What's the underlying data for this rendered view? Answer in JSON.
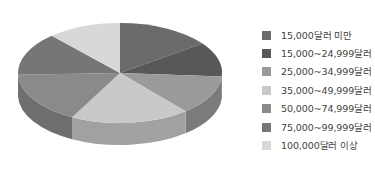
{
  "chart_data": {
    "type": "pie",
    "title": "",
    "subtitle": "",
    "xlabel": "",
    "ylabel": "",
    "three_d": true,
    "legend_position": "right",
    "grid": false,
    "categories": [
      "15,000달러 미만",
      "15,000~24,999달러",
      "25,000~34,999달러",
      "35,000~49,999달러",
      "50,000~74,999달러",
      "75,000~99,999달러",
      "100,000달러 이상"
    ],
    "values": [
      15,
      11,
      13,
      19,
      17,
      14,
      11
    ],
    "colors": [
      "#6b6b6b",
      "#585858",
      "#9a9a9a",
      "#c9c9c9",
      "#8a8a8a",
      "#767676",
      "#d8d8d8"
    ],
    "slices": [
      {
        "label": "15,000달러 미만",
        "value": 15,
        "color": "#6b6b6b",
        "start_angle": 0,
        "end_angle": 54
      },
      {
        "label": "15,000~24,999달러",
        "value": 11,
        "color": "#585858",
        "start_angle": 54,
        "end_angle": 94
      },
      {
        "label": "25,000~34,999달러",
        "value": 13,
        "color": "#9a9a9a",
        "start_angle": 94,
        "end_angle": 140
      },
      {
        "label": "35,000~49,999달러",
        "value": 19,
        "color": "#c9c9c9",
        "start_angle": 140,
        "end_angle": 208
      },
      {
        "label": "50,000~74,999달러",
        "value": 17,
        "color": "#8a8a8a",
        "start_angle": 208,
        "end_angle": 268
      },
      {
        "label": "75,000~99,999달러",
        "value": 14,
        "color": "#767676",
        "start_angle": 268,
        "end_angle": 318
      },
      {
        "label": "100,000달러 이상",
        "value": 11,
        "color": "#d8d8d8",
        "start_angle": 318,
        "end_angle": 360
      }
    ]
  },
  "legend": {
    "items": [
      {
        "label": "15,000달러 미만",
        "color": "#6b6b6b"
      },
      {
        "label": "15,000~24,999달러",
        "color": "#585858"
      },
      {
        "label": "25,000~34,999달러",
        "color": "#9a9a9a"
      },
      {
        "label": "35,000~49,999달러",
        "color": "#c9c9c9"
      },
      {
        "label": "50,000~74,999달러",
        "color": "#8a8a8a"
      },
      {
        "label": "75,000~99,999달러",
        "color": "#767676"
      },
      {
        "label": "100,000달러 이상",
        "color": "#d8d8d8"
      }
    ]
  }
}
